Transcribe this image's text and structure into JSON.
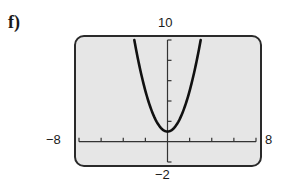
{
  "part_label": "f)",
  "window": {
    "ymax_label": "10",
    "ymin_label": "−2",
    "xmin_label": "−8",
    "xmax_label": "8"
  },
  "colors": {
    "screen_bg": "#e6e6e6",
    "frame": "#2a2a2a",
    "curve": "#111111"
  },
  "chart_data": {
    "type": "line",
    "title": "",
    "xlabel": "",
    "ylabel": "",
    "xlim": [
      -8,
      8
    ],
    "ylim": [
      -2,
      10
    ],
    "x_tick_step": 2,
    "y_tick_step": 2,
    "grid": false,
    "legend": null,
    "series": [
      {
        "name": "y = x^2 + 1",
        "x": [
          -3,
          -2.5,
          -2,
          -1.5,
          -1,
          -0.5,
          0,
          0.5,
          1,
          1.5,
          2,
          2.5,
          3
        ],
        "values": [
          10,
          7.25,
          5,
          3.25,
          2,
          1.25,
          1,
          1.25,
          2,
          3.25,
          5,
          7.25,
          10
        ]
      }
    ],
    "annotations": [
      "10",
      "−2",
      "−8",
      "8"
    ]
  }
}
